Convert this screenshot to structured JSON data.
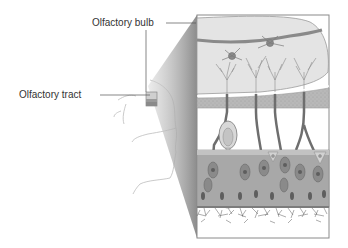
{
  "figure": {
    "labels": {
      "olfactory_bulb": "Olfactory bulb",
      "olfactory_tract": "Olfactory tract"
    },
    "colors": {
      "panel_border": "#8a8a8a",
      "bulb_fill": "#e6e6e6",
      "bone_layer": "#b5b5b5",
      "epithelium": "#a8a8a8",
      "cell_nucleus": "#6a6a6a",
      "neuron": "#707070",
      "projection_wedge": "#9a9a9a",
      "face_outline": "#bdbdbd"
    }
  }
}
